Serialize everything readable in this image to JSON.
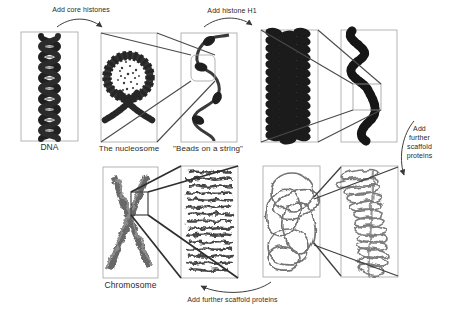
{
  "figure": {
    "stages": {
      "dna": {
        "label": "DNA"
      },
      "nucleosome": {
        "label": "The nucleosome"
      },
      "beads_on_a_string": {
        "label": "\"Beads on a string\""
      },
      "chromosome": {
        "label": "Chromosome"
      }
    },
    "annotations": {
      "add_core_histones": "Add core histones",
      "add_histone_h1": "Add histone H1",
      "add_further_scaffold_right": "Add\nfurther\nscaffold\nproteins",
      "add_further_scaffold_bottom": "Add further scaffold proteins"
    },
    "colors": {
      "ink": "#1c1c1c",
      "scribble_gray": "#6b6b6b",
      "box_border": "#a3a3a3",
      "connector_line": "#4a4a4a",
      "text": "#2a2a2a",
      "background": "#ffffff"
    }
  }
}
